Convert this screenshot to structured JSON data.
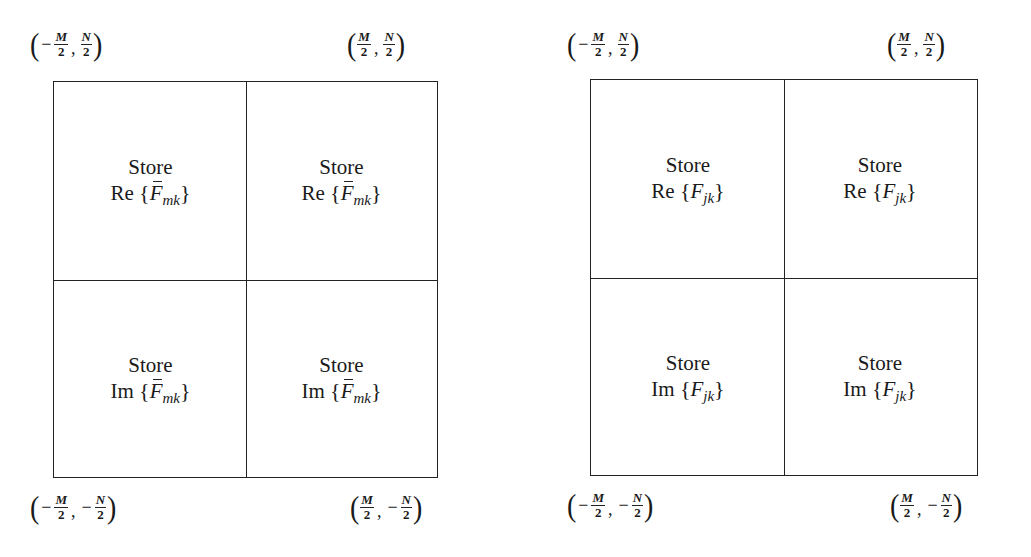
{
  "diagram": {
    "panels": [
      {
        "id": "left",
        "corners": {
          "top_left": {
            "x_sign": "-",
            "x_num": "M",
            "x_den": "2",
            "y_sign": "",
            "y_num": "N",
            "y_den": "2"
          },
          "top_right": {
            "x_sign": "",
            "x_num": "M",
            "x_den": "2",
            "y_sign": "",
            "y_num": "N",
            "y_den": "2"
          },
          "bottom_left": {
            "x_sign": "-",
            "x_num": "M",
            "x_den": "2",
            "y_sign": "-",
            "y_num": "N",
            "y_den": "2"
          },
          "bottom_right": {
            "x_sign": "",
            "x_num": "M",
            "x_den": "2",
            "y_sign": "-",
            "y_num": "N",
            "y_den": "2"
          }
        },
        "cells": [
          {
            "position": "top-left",
            "verb": "Store",
            "op": "Re",
            "var": "F",
            "overbar": true,
            "subscript": "mk"
          },
          {
            "position": "top-right",
            "verb": "Store",
            "op": "Re",
            "var": "F",
            "overbar": true,
            "subscript": "mk"
          },
          {
            "position": "bottom-left",
            "verb": "Store",
            "op": "Im",
            "var": "F",
            "overbar": true,
            "subscript": "mk"
          },
          {
            "position": "bottom-right",
            "verb": "Store",
            "op": "Im",
            "var": "F",
            "overbar": true,
            "subscript": "mk"
          }
        ]
      },
      {
        "id": "right",
        "corners": {
          "top_left": {
            "x_sign": "-",
            "x_num": "M",
            "x_den": "2",
            "y_sign": "",
            "y_num": "N",
            "y_den": "2"
          },
          "top_right": {
            "x_sign": "",
            "x_num": "M",
            "x_den": "2",
            "y_sign": "",
            "y_num": "N",
            "y_den": "2"
          },
          "bottom_left": {
            "x_sign": "-",
            "x_num": "M",
            "x_den": "2",
            "y_sign": "-",
            "y_num": "N",
            "y_den": "2"
          },
          "bottom_right": {
            "x_sign": "",
            "x_num": "M",
            "x_den": "2",
            "y_sign": "-",
            "y_num": "N",
            "y_den": "2"
          }
        },
        "cells": [
          {
            "position": "top-left",
            "verb": "Store",
            "op": "Re",
            "var": "F",
            "overbar": false,
            "subscript": "jk"
          },
          {
            "position": "top-right",
            "verb": "Store",
            "op": "Re",
            "var": "F",
            "overbar": false,
            "subscript": "jk"
          },
          {
            "position": "bottom-left",
            "verb": "Store",
            "op": "Im",
            "var": "F",
            "overbar": false,
            "subscript": "jk"
          },
          {
            "position": "bottom-right",
            "verb": "Store",
            "op": "Im",
            "var": "F",
            "overbar": false,
            "subscript": "jk"
          }
        ]
      }
    ],
    "symbols": {
      "brace_open": "{",
      "brace_close": "}",
      "paren_open": "(",
      "paren_close": ")",
      "comma": ",",
      "minus": "−"
    },
    "colors": {
      "line": "#222222",
      "text": "#1a1a1a",
      "background": "#ffffff"
    }
  }
}
